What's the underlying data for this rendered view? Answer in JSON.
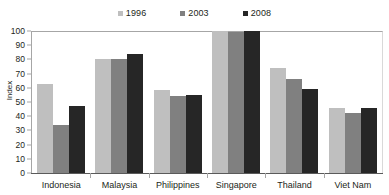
{
  "chart_data": {
    "type": "bar",
    "title": "",
    "xlabel": "",
    "ylabel": "Index",
    "ylim": [
      0,
      100
    ],
    "yticks": [
      0,
      10,
      20,
      30,
      40,
      50,
      60,
      70,
      80,
      90,
      100
    ],
    "grid": false,
    "legend_position": "top-center",
    "categories": [
      "Indonesia",
      "Malaysia",
      "Philippines",
      "Singapore",
      "Thailand",
      "Viet Nam"
    ],
    "series": [
      {
        "name": "1996",
        "color": "#bfbfbf",
        "values": [
          63,
          80,
          58.5,
          100,
          74,
          45.5
        ]
      },
      {
        "name": "2003",
        "color": "#808080",
        "values": [
          33.5,
          80,
          54,
          99,
          66,
          42
        ]
      },
      {
        "name": "2008",
        "color": "#262626",
        "values": [
          47.5,
          84,
          55,
          100,
          59,
          46
        ]
      }
    ]
  },
  "axis": {
    "y_title": "Index",
    "y_tick_labels": [
      "100",
      "90",
      "80",
      "70",
      "60",
      "50",
      "40",
      "30",
      "20",
      "10",
      "0"
    ]
  },
  "legend": {
    "entries": [
      {
        "label": "1996",
        "color": "#bfbfbf"
      },
      {
        "label": "2003",
        "color": "#808080"
      },
      {
        "label": "2008",
        "color": "#262626"
      }
    ]
  }
}
